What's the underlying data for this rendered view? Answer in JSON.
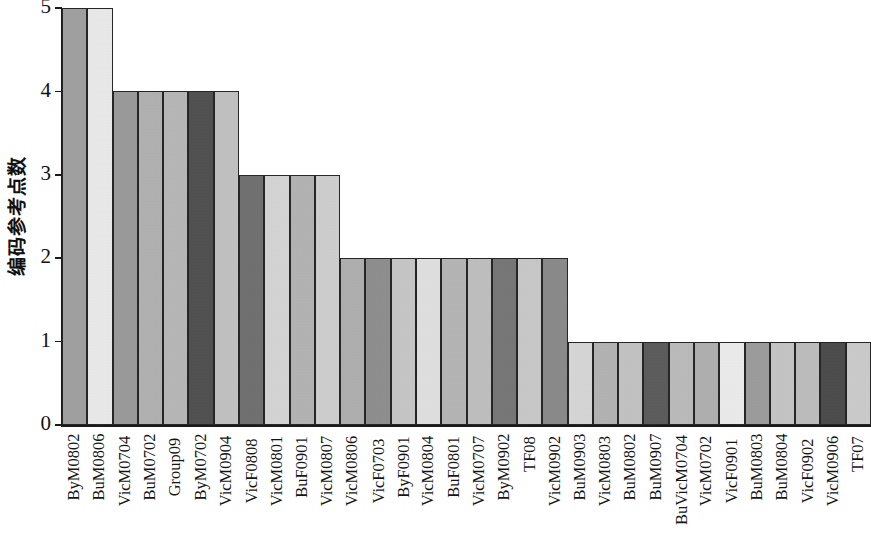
{
  "chart_data": {
    "type": "bar",
    "title": "",
    "subtitle": "",
    "xlabel": "",
    "ylabel": "编码参考点数",
    "ylim": [
      0,
      5
    ],
    "yticks": [
      0,
      1,
      2,
      3,
      4,
      5
    ],
    "ytick_labels": [
      "0",
      "1",
      "2",
      "3",
      "4",
      "5"
    ],
    "grid": false,
    "legend": null,
    "legend_position": "none",
    "orientation": "vertical",
    "categories": [
      "ByM0802",
      "BuM0806",
      "VicM0704",
      "BuM0702",
      "Group09",
      "ByM0702",
      "VicM0904",
      "VicF0808",
      "VicM0801",
      "BuF0901",
      "VicM0807",
      "VicM0806",
      "VicF0703",
      "ByF0901",
      "VicM0804",
      "BuF0801",
      "VicM0707",
      "ByM0902",
      "TF08",
      "VicM0902",
      "BuM0903",
      "VicM0803",
      "BuM0802",
      "BuM0907",
      "BuVicM0704",
      "VicM0702",
      "VicF0901",
      "BuM0803",
      "BuM0804",
      "VicF0902",
      "VicM0906",
      "TF07"
    ],
    "values": [
      5,
      5,
      4,
      4,
      4,
      4,
      4,
      3,
      3,
      3,
      3,
      2,
      2,
      2,
      2,
      2,
      2,
      2,
      2,
      2,
      1,
      1,
      1,
      1,
      1,
      1,
      1,
      1,
      1,
      1,
      1,
      1
    ],
    "bar_colors": [
      "#a0a0a0",
      "#ececec",
      "#9a9a9a",
      "#b2b2b2",
      "#b8b8b8",
      "#4e4e4e",
      "#c2c2c2",
      "#6f6f6f",
      "#d6d6d6",
      "#b4b4b4",
      "#d0d0d0",
      "#b0b0b0",
      "#8e8e8e",
      "#c8c8c8",
      "#e2e2e2",
      "#b6b6b6",
      "#c0c0c0",
      "#767676",
      "#cacaca",
      "#8a8a8a",
      "#d8d8d8",
      "#b4b4b4",
      "#c4c4c4",
      "#5a5a5a",
      "#bcbcbc",
      "#b0b0b0",
      "#eeeeee",
      "#9c9c9c",
      "#c6c6c6",
      "#bebebe",
      "#4a4a4a",
      "#cdcdcd"
    ],
    "bar_count": 32,
    "bar_edge_color": "#262626",
    "axis_color": "#1a1a1a",
    "background_color": "#ffffff",
    "text_color": "#111111"
  }
}
